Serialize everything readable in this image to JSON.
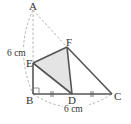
{
  "diagram": {
    "title": "",
    "points": {
      "A": {
        "label": "A",
        "x": 33,
        "y": 9
      },
      "B": {
        "label": "B",
        "x": 33,
        "y": 94
      },
      "C": {
        "label": "C",
        "x": 112,
        "y": 94
      },
      "D": {
        "label": "D",
        "x": 72,
        "y": 94
      },
      "E": {
        "label": "E",
        "x": 33,
        "y": 63
      },
      "F": {
        "label": "F",
        "x": 67,
        "y": 47
      }
    },
    "labels": {
      "A": "A",
      "B": "B",
      "C": "C",
      "D": "D",
      "E": "E",
      "F": "F"
    },
    "dimensions": {
      "AB": "6 cm",
      "BC": "6 cm"
    },
    "marks": {
      "right_angle_at": "B",
      "equal_segments": [
        "BD",
        "DC"
      ]
    },
    "colors": {
      "stroke": "#555555",
      "dashed": "#aaaaaa",
      "fill": "#e4e4e4"
    }
  }
}
